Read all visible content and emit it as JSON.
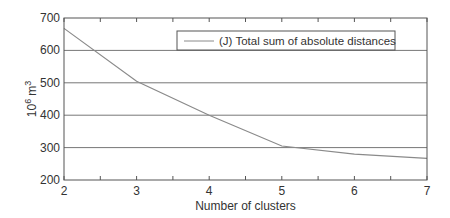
{
  "chart_data": {
    "type": "line",
    "title": "",
    "xlabel": "Number of clusters",
    "ylabel": "10^6 m^3",
    "ylabel_base": "10",
    "ylabel_exp1": "6",
    "ylabel_unit": "m",
    "ylabel_exp2": "3",
    "x": [
      2,
      3,
      4,
      5,
      6,
      7
    ],
    "series": [
      {
        "name": "(J) Total sum of absolute distances",
        "values": [
          668,
          505,
          400,
          305,
          280,
          267
        ],
        "color": "#8a8a8a"
      }
    ],
    "xlim": [
      2,
      7
    ],
    "ylim": [
      200,
      700
    ],
    "xticks": [
      2,
      3,
      4,
      5,
      6,
      7
    ],
    "yticks": [
      200,
      300,
      400,
      500,
      600,
      700
    ],
    "grid": "horizontal",
    "legend_position": "upper right"
  }
}
